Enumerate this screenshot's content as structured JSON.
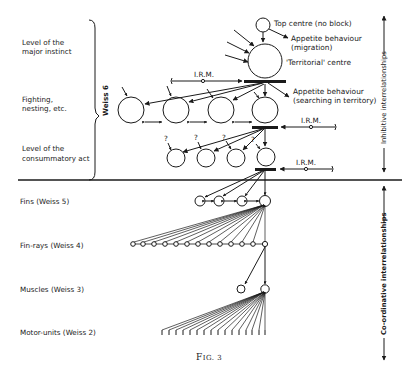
{
  "figure": {
    "caption": "Fig. 3",
    "caption_main": "F",
    "caption_small": "IG. 3"
  },
  "left_labels": {
    "major_instinct": [
      "Level of the",
      "major instinct"
    ],
    "fighting": [
      "Fighting,",
      "nesting, etc."
    ],
    "consummatory": [
      "Level of the",
      "consummatory act"
    ],
    "fins": "Fins (Weiss 5)",
    "fin_rays": "Fin-rays (Weiss 4)",
    "muscles": "Muscles (Weiss 3)",
    "motor_units": "Motor-units (Weiss 2)"
  },
  "brace_label": "Weiss 6",
  "node_labels": {
    "top_centre": "Top centre (no block)",
    "appetite_migration": [
      "Appetite behaviour",
      "(migration)"
    ],
    "territorial": "'Territorial' centre",
    "appetite_searching": [
      "Appetite behaviour",
      "(searching in territory)"
    ],
    "irm": "I.R.M.",
    "question": "?"
  },
  "right_axis": {
    "inhibitive": "Inhibitive interrelationships",
    "coordinative": "Co-ordinative interrelationships"
  },
  "colors": {
    "ink": "#1a1a1a",
    "background": "#ffffff"
  }
}
